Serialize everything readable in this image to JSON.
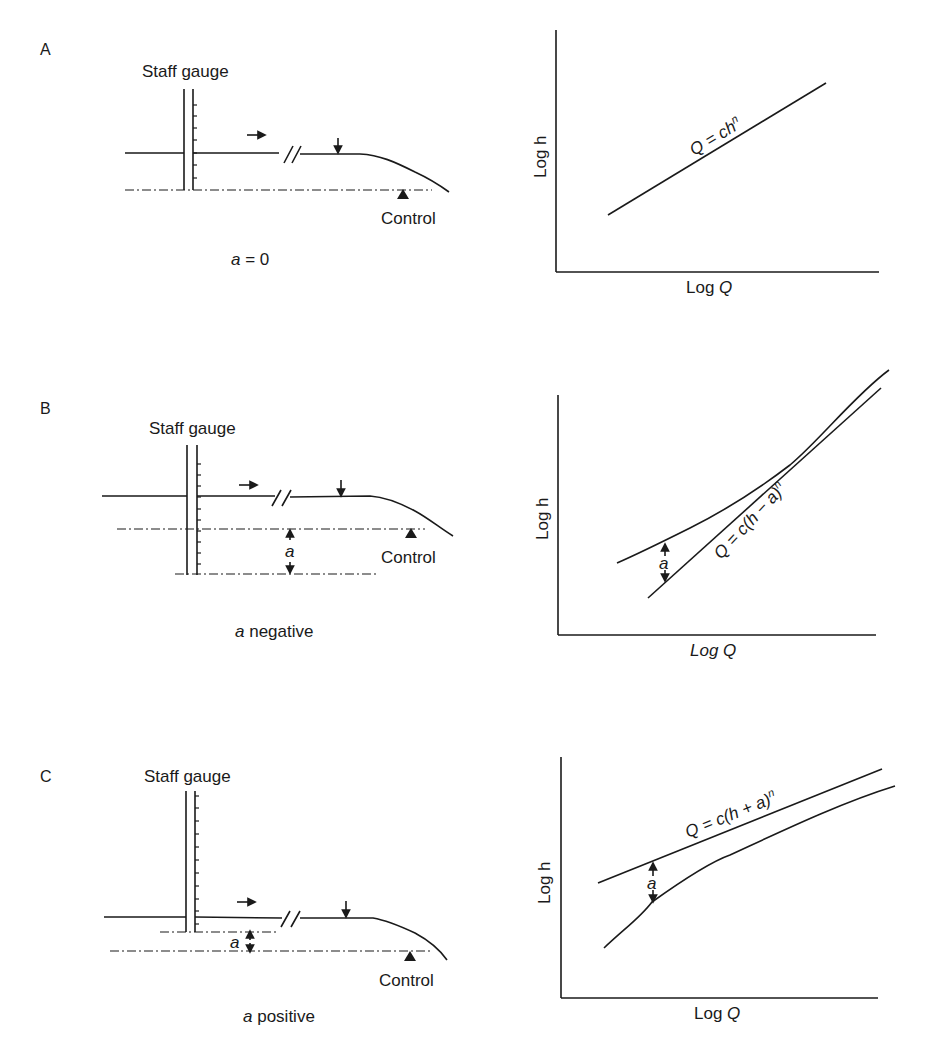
{
  "figure": {
    "panels": [
      {
        "id": "A",
        "letter": "A",
        "gauge_label": "Staff gauge",
        "control_label": "Control",
        "caption_var": "a",
        "caption_rest": " = 0",
        "chart": {
          "ylabel": "Log h",
          "xlabel_prefix": "Log ",
          "xlabel_var": "Q",
          "equation": "Q = ch",
          "equation_exp": "n"
        }
      },
      {
        "id": "B",
        "letter": "B",
        "gauge_label": "Staff gauge",
        "control_label": "Control",
        "offset_label": "a",
        "caption_var": "a",
        "caption_rest": " negative",
        "chart": {
          "ylabel": "Log h",
          "xlabel_prefix": "Log ",
          "xlabel_var": "Q",
          "equation": "Q = c(h − a)",
          "equation_exp": "n",
          "offset_label": "a"
        }
      },
      {
        "id": "C",
        "letter": "C",
        "gauge_label": "Staff gauge",
        "control_label": "Control",
        "offset_label": "a",
        "caption_var": "a",
        "caption_rest": " positive",
        "chart": {
          "ylabel": "Log h",
          "xlabel_prefix": "Log ",
          "xlabel_var": "Q",
          "equation": "Q = c(h + a)",
          "equation_exp": "n",
          "offset_label": "a"
        }
      }
    ]
  }
}
